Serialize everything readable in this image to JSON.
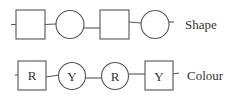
{
  "rows": [
    {
      "label": "Shape",
      "nodes": [
        {
          "shape": "square",
          "text": ""
        },
        {
          "shape": "circle",
          "text": ""
        },
        {
          "shape": "square",
          "text": ""
        },
        {
          "shape": "circle",
          "text": ""
        }
      ]
    },
    {
      "label": "Colour",
      "nodes": [
        {
          "shape": "square",
          "text": "R"
        },
        {
          "shape": "circle",
          "text": "Y"
        },
        {
          "shape": "circle",
          "text": "R"
        },
        {
          "shape": "square",
          "text": "Y"
        }
      ]
    }
  ]
}
